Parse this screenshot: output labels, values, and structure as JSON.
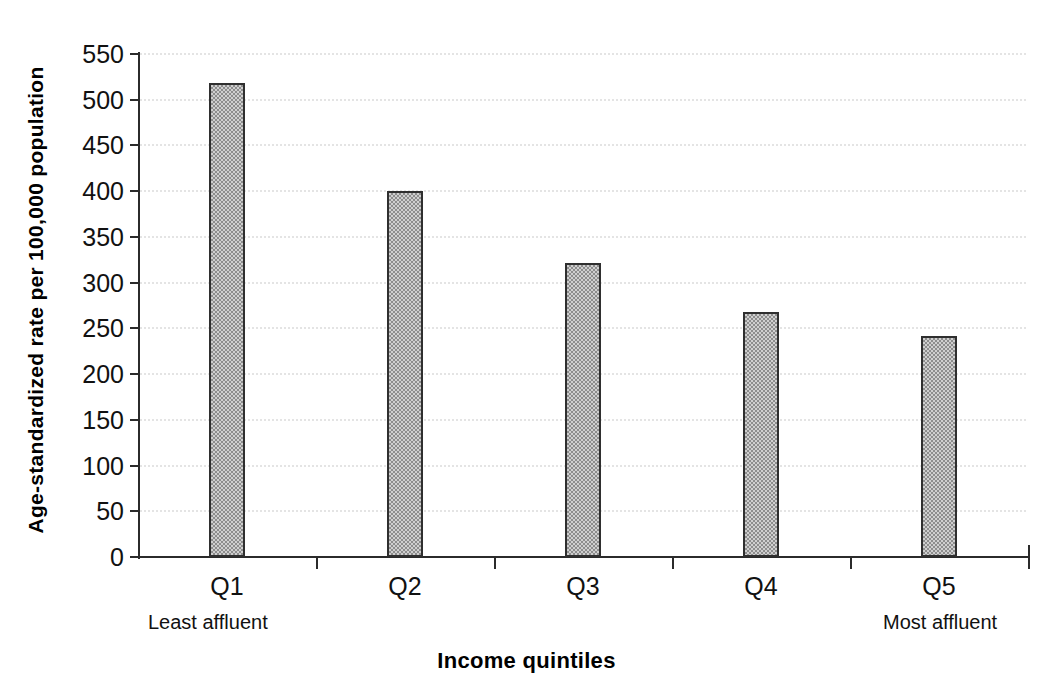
{
  "chart_data": {
    "type": "bar",
    "title": "",
    "categories": [
      "Q1",
      "Q2",
      "Q3",
      "Q4",
      "Q5"
    ],
    "values": [
      518,
      400,
      322,
      268,
      242
    ],
    "series": [
      {
        "name": "Age-standardized rate per 100,000 population",
        "values": [
          518,
          400,
          322,
          268,
          242
        ]
      }
    ],
    "xlabel": "Income quintiles",
    "ylabel": "Age-standardized rate per 100,000 population",
    "ylim": [
      0,
      550
    ],
    "ytick_step": 50,
    "yticks": [
      550,
      500,
      450,
      400,
      350,
      300,
      250,
      200,
      150,
      100,
      50,
      0
    ],
    "ytick_labels": [
      "550",
      "500",
      "450",
      "400",
      "350",
      "300",
      "250",
      "200",
      "150",
      "100",
      "50",
      "0"
    ],
    "grid": "horizontal-dotted",
    "legend": "none",
    "annotations": [
      {
        "text": "Least affluent",
        "anchor": "Q1"
      },
      {
        "text": "Most affluent",
        "anchor": "Q5"
      }
    ],
    "bar_fill_color": "#a8a8a8",
    "bar_edge_color": "#2f2f2f",
    "axis_color": "#2b2b2b",
    "gridline_color": "#c9c9c9",
    "background_color": "#ffffff"
  },
  "axes": {
    "y_title": "Age-standardized rate per 100,000 population",
    "x_title": "Income quintiles"
  },
  "annotations": {
    "least_affluent": "Least affluent",
    "most_affluent": "Most affluent"
  }
}
